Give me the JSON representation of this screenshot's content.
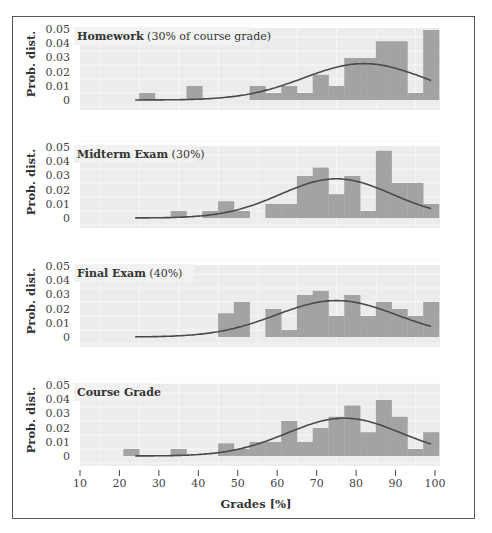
{
  "chart_data": {
    "type": "bar",
    "layout": "4 stacked histogram panels sharing x-axis, each with a normal-distribution fit curve",
    "bin_edges": [
      21,
      25,
      29,
      33,
      37,
      41,
      45,
      49,
      53,
      57,
      61,
      65,
      69,
      73,
      77,
      81,
      85,
      89,
      93,
      97,
      101
    ],
    "xlabel": "Grades [%]",
    "xticks": [
      10,
      20,
      30,
      40,
      50,
      60,
      70,
      80,
      90,
      100
    ],
    "xlim": [
      10,
      100
    ],
    "ylabel": "Prob. dist.",
    "yticks": [
      "0",
      "0.01",
      "0.02",
      "0.03",
      "0.04",
      "0.05"
    ],
    "ylim": [
      0,
      0.05
    ],
    "grid": true,
    "colors": {
      "bar": "#a3a3a3",
      "plot_bg": "#ececec",
      "grid": "#f8f8f8",
      "curve": "#4a4a4a",
      "frame": "#555555"
    },
    "panels": [
      {
        "title_bold": "Homework",
        "title_rest": " (30% of course grade)",
        "values": [
          0,
          0.005,
          0,
          0,
          0.01,
          0,
          0,
          0,
          0.01,
          0.005,
          0.01,
          0.005,
          0.018,
          0.01,
          0.03,
          0.03,
          0.042,
          0.042,
          0.005,
          0.05
        ],
        "fit": {
          "mean": 82,
          "peak": 0.026,
          "sd": 15.3,
          "range": [
            24,
            99
          ]
        }
      },
      {
        "title_bold": "Midterm Exam",
        "title_rest": " (30%)",
        "values": [
          0,
          0,
          0,
          0.005,
          0,
          0.005,
          0.012,
          0.005,
          0,
          0.01,
          0.01,
          0.03,
          0.036,
          0.017,
          0.03,
          0.005,
          0.048,
          0.025,
          0.025,
          0.01
        ],
        "fit": {
          "mean": 75,
          "peak": 0.028,
          "sd": 14.2,
          "range": [
            24,
            99
          ]
        }
      },
      {
        "title_bold": "Final Exam",
        "title_rest": " (40%)",
        "values": [
          0,
          0,
          0,
          0,
          0,
          0,
          0.017,
          0.025,
          0,
          0.02,
          0.005,
          0.03,
          0.033,
          0.015,
          0.03,
          0.015,
          0.025,
          0.02,
          0.015,
          0.025
        ],
        "fit": {
          "mean": 75,
          "peak": 0.026,
          "sd": 15.3,
          "range": [
            24,
            99
          ]
        }
      },
      {
        "title_bold": "Course Grade",
        "title_rest": "",
        "values": [
          0.005,
          0,
          0,
          0.005,
          0,
          0,
          0.009,
          0.005,
          0.01,
          0.01,
          0.025,
          0.01,
          0.02,
          0.028,
          0.036,
          0.017,
          0.04,
          0.028,
          0.005,
          0.017
        ],
        "fit": {
          "mean": 77,
          "peak": 0.027,
          "sd": 14.5,
          "range": [
            24,
            99
          ]
        }
      }
    ]
  }
}
